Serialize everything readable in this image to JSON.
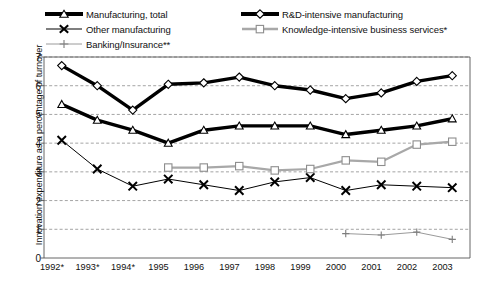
{
  "chart_data": {
    "type": "line",
    "title": "",
    "xlabel": "",
    "ylabel": "Innovation expenditure as a percentage of turnover",
    "categories": [
      "1992*",
      "1993*",
      "1994*",
      "1995",
      "1996",
      "1997",
      "1998",
      "1999",
      "2000",
      "2001",
      "2002",
      "2003"
    ],
    "ylim": [
      0,
      7
    ],
    "yticks": [
      "0",
      "1",
      "2",
      "3",
      "4",
      "5",
      "6",
      "7"
    ],
    "grid": true,
    "legend_position": "top",
    "series": [
      {
        "name": "Manufacturing, total",
        "marker": "triangle-open",
        "color": "#000000",
        "line_width": "thick",
        "values": [
          5.35,
          4.8,
          4.45,
          4.0,
          4.45,
          4.6,
          4.6,
          4.6,
          4.3,
          4.45,
          4.6,
          4.85
        ]
      },
      {
        "name": "Other manufacturing",
        "marker": "x",
        "color": "#000000",
        "line_width": "thin",
        "values": [
          4.1,
          3.1,
          2.5,
          2.75,
          2.55,
          2.35,
          2.65,
          2.8,
          2.35,
          2.55,
          2.5,
          2.45
        ]
      },
      {
        "name": "Banking/Insurance**",
        "marker": "plus",
        "color": "#9a9a9a",
        "line_width": "thin",
        "values": [
          null,
          null,
          null,
          null,
          null,
          null,
          null,
          null,
          0.85,
          0.8,
          0.9,
          0.65
        ]
      },
      {
        "name": "R&D-intensive manufacturing",
        "marker": "diamond-open",
        "color": "#000000",
        "line_width": "thick",
        "values": [
          6.7,
          6.0,
          5.15,
          6.05,
          6.1,
          6.3,
          6.0,
          5.85,
          5.55,
          5.75,
          6.15,
          6.35
        ]
      },
      {
        "name": "Knowledge-intensive business services*",
        "marker": "square-open",
        "color": "#a8a8a8",
        "line_width": "medium",
        "values": [
          null,
          null,
          null,
          3.15,
          3.15,
          3.2,
          3.05,
          3.1,
          3.4,
          3.35,
          3.95,
          4.05
        ]
      }
    ]
  },
  "legend": {
    "items": [
      {
        "label": "Manufacturing, total",
        "key": "thick-line-triangle-marker"
      },
      {
        "label": "Other manufacturing",
        "key": "thin-line-x-marker"
      },
      {
        "label": "Banking/Insurance**",
        "key": "thin-gray-line-plus-marker"
      },
      {
        "label": "R&D-intensive manufacturing",
        "key": "thick-line-diamond-marker"
      },
      {
        "label": "Knowledge-intensive business services*",
        "key": "gray-line-square-marker"
      }
    ]
  },
  "axes": {
    "y_title": "Innovation expenditure as a percentage of turnover",
    "y_ticks": [
      "7",
      "6",
      "5",
      "4",
      "3",
      "2",
      "1",
      "0"
    ],
    "x_ticks": [
      "1992*",
      "1993*",
      "1994*",
      "1995",
      "1996",
      "1997",
      "1998",
      "1999",
      "2000",
      "2001",
      "2002",
      "2003"
    ]
  }
}
